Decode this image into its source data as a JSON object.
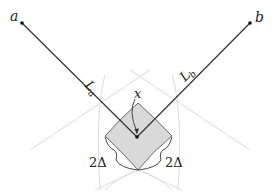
{
  "diagram": {
    "points": {
      "a": {
        "label": "a"
      },
      "b": {
        "label": "b"
      },
      "x": {
        "label": "x"
      }
    },
    "segments": {
      "La": {
        "main": "L",
        "sub": "a"
      },
      "Lb": {
        "main": "L",
        "sub": "b"
      }
    },
    "widths": {
      "left": "2Δ",
      "right": "2Δ"
    },
    "colors": {
      "line": "#333333",
      "fill": "#d9d9d9",
      "arc": "#d6d6d6"
    }
  }
}
